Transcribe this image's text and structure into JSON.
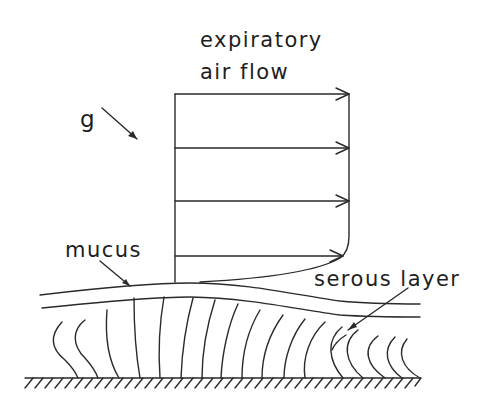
{
  "diagram": {
    "labels": {
      "flow_line1": "expiratory",
      "flow_line2": "air flow",
      "gravity": "g",
      "mucus": "mucus",
      "serous": "serous layer"
    },
    "colors": {
      "ink": "#2a2a2a",
      "background": "#ffffff"
    },
    "velocity_profile": {
      "arrow_count": 4,
      "description": "Expiratory air-flow velocity profile above mucus layer"
    },
    "layers": [
      "air",
      "mucus",
      "serous layer",
      "cilia",
      "epithelium wall"
    ]
  }
}
